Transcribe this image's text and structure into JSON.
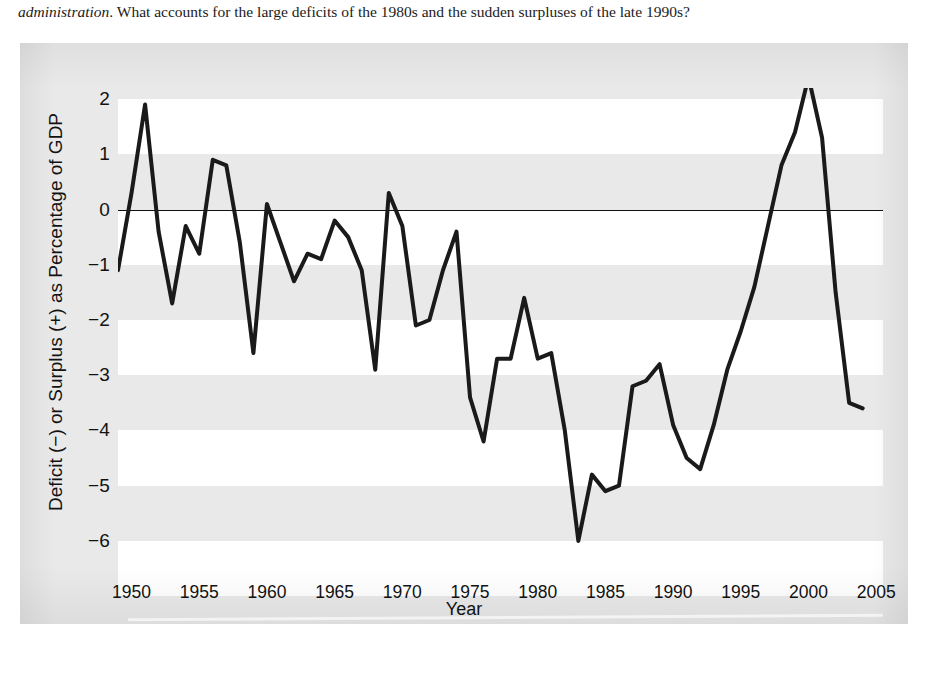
{
  "body_text": {
    "italic_lead": "administration",
    "rest": ". What accounts for the large deficits of the 1980s and the sudden surpluses of the late 1990s?"
  },
  "caption": "",
  "colors": {
    "panel_background": "#e9e9e9",
    "band_white": "#ffffff",
    "series_line": "#1a1a1a",
    "zero_line": "#111111",
    "text": "#121212"
  },
  "chart_data": {
    "type": "line",
    "title": "",
    "xlabel": "Year",
    "ylabel": "Deficit (−) or Surplus (+) as Percentage of GDP",
    "xlim": [
      1949,
      2005.5
    ],
    "ylim": [
      -6.4,
      2.2
    ],
    "xticks": [
      1950,
      1955,
      1960,
      1965,
      1970,
      1975,
      1980,
      1985,
      1990,
      1995,
      2000,
      2005
    ],
    "xticklabels": [
      "1950",
      "1955",
      "1960",
      "1965",
      "1970",
      "1975",
      "1980",
      "1985",
      "1990",
      "1995",
      "2000",
      "2005"
    ],
    "yticks": [
      2,
      1,
      0,
      -1,
      -2,
      -3,
      -4,
      -5,
      -6
    ],
    "yticklabels": [
      "2",
      "1",
      "0",
      "−1",
      "−2",
      "−3",
      "−4",
      "−5",
      "−6"
    ],
    "grid": false,
    "banded_background": true,
    "band_unit": 1,
    "legend": null,
    "zero_reference_line": 0,
    "series": [
      {
        "name": "Federal budget deficit (−) or surplus (+) as percentage of GDP",
        "x": [
          1949,
          1950,
          1951,
          1952,
          1953,
          1954,
          1955,
          1956,
          1957,
          1958,
          1959,
          1960,
          1961,
          1962,
          1963,
          1964,
          1965,
          1966,
          1967,
          1968,
          1969,
          1970,
          1971,
          1972,
          1973,
          1974,
          1975,
          1976,
          1977,
          1978,
          1979,
          1980,
          1981,
          1982,
          1983,
          1984,
          1985,
          1986,
          1987,
          1988,
          1989,
          1990,
          1991,
          1992,
          1993,
          1994,
          1995,
          1996,
          1997,
          1998,
          1999,
          2000,
          2001,
          2002,
          2003,
          2004
        ],
        "values": [
          -1.1,
          0.3,
          1.9,
          -0.4,
          -1.7,
          -0.3,
          -0.8,
          0.9,
          0.8,
          -0.6,
          -2.6,
          0.1,
          -0.6,
          -1.3,
          -0.8,
          -0.9,
          -0.2,
          -0.5,
          -1.1,
          -2.9,
          0.3,
          -0.3,
          -2.1,
          -2.0,
          -1.1,
          -0.4,
          -3.4,
          -4.2,
          -2.7,
          -2.7,
          -1.6,
          -2.7,
          -2.6,
          -4.0,
          -6.0,
          -4.8,
          -5.1,
          -5.0,
          -3.2,
          -3.1,
          -2.8,
          -3.9,
          -4.5,
          -4.7,
          -3.9,
          -2.9,
          -2.2,
          -1.4,
          -0.3,
          0.8,
          1.4,
          2.4,
          1.3,
          -1.5,
          -3.5,
          -3.6
        ]
      }
    ]
  }
}
